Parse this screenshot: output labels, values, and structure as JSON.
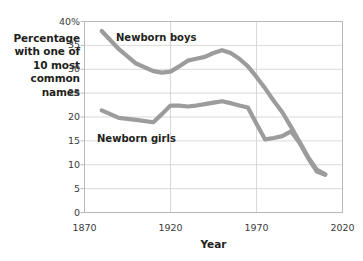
{
  "chart_data": {
    "type": "line",
    "title": "",
    "xlabel": "Year",
    "ylabel": "Percentage with one of 10 most common names",
    "xlim": [
      1870,
      2020
    ],
    "ylim": [
      0,
      40
    ],
    "grid": true,
    "legend_position": "inline-labels",
    "x_ticks": [
      "1870",
      "1920",
      "1970",
      "2020"
    ],
    "y_ticks": [
      "0",
      "5",
      "10",
      "15",
      "20",
      "25",
      "30",
      "35",
      "40%"
    ],
    "series": [
      {
        "name": "Newborn boys",
        "color": "#9c9c9c",
        "x": [
          1880,
          1890,
          1900,
          1910,
          1915,
          1920,
          1925,
          1930,
          1935,
          1940,
          1945,
          1950,
          1955,
          1960,
          1965,
          1970,
          1975,
          1980,
          1985,
          1990,
          1995,
          2000,
          2005,
          2010
        ],
        "values": [
          38.0,
          34.2,
          31.2,
          29.6,
          29.3,
          29.5,
          30.6,
          31.8,
          32.2,
          32.6,
          33.4,
          34.0,
          33.4,
          32.2,
          30.6,
          28.4,
          26.0,
          23.4,
          21.0,
          18.0,
          14.8,
          11.6,
          9.0,
          8.0
        ]
      },
      {
        "name": "Newborn girls",
        "color": "#9c9c9c",
        "x": [
          1880,
          1890,
          1900,
          1910,
          1915,
          1920,
          1925,
          1930,
          1935,
          1940,
          1945,
          1950,
          1955,
          1960,
          1965,
          1970,
          1975,
          1980,
          1985,
          1990,
          1995,
          2000,
          2005,
          2010
        ],
        "values": [
          21.4,
          19.8,
          19.4,
          18.9,
          20.6,
          22.4,
          22.4,
          22.2,
          22.4,
          22.7,
          23.0,
          23.3,
          22.9,
          22.4,
          22.0,
          18.6,
          15.3,
          15.6,
          16.0,
          17.0,
          14.6,
          11.4,
          8.6,
          7.9
        ]
      }
    ],
    "labels": {
      "boys": "Newborn boys",
      "girls": "Newborn girls"
    }
  },
  "axis": {
    "x_title": "Year",
    "y_title_lines": [
      "Percentage",
      "with one of",
      "10 most",
      "common",
      "names"
    ]
  }
}
